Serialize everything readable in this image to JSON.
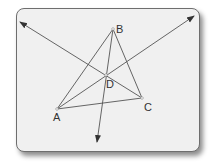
{
  "diagram": {
    "title": "",
    "points": {
      "A": {
        "label": "A",
        "x": 57,
        "y": 109
      },
      "B": {
        "label": "B",
        "x": 113,
        "y": 29
      },
      "C": {
        "label": "C",
        "x": 142,
        "y": 98
      },
      "D": {
        "label": "D",
        "x": 106,
        "y": 75
      }
    },
    "segments": [
      [
        "A",
        "B"
      ],
      [
        "B",
        "C"
      ],
      [
        "A",
        "C"
      ]
    ],
    "rays": [
      {
        "from": "A",
        "through": "D",
        "end": [
          194,
          16
        ]
      },
      {
        "from": "C",
        "through": "D",
        "end": [
          20,
          22
        ]
      },
      {
        "from": "B",
        "through": "D",
        "end": [
          97,
          142
        ]
      }
    ],
    "colors": {
      "line": "#555555",
      "background": "#f0f0f0",
      "border": "#6e6e6e"
    }
  }
}
